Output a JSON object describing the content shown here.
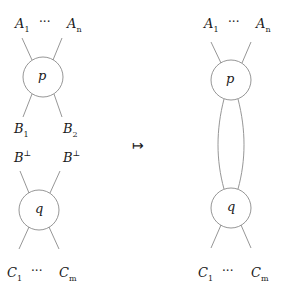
{
  "left": {
    "top_labels": {
      "first": "A",
      "first_sub": "1",
      "dots": "···",
      "last": "A",
      "last_sub": "n"
    },
    "node_p": "p",
    "mid_labels": {
      "b1": "B",
      "b1_sub": "1",
      "b2": "B",
      "b2_sub": "2"
    },
    "dual_labels": {
      "b1": "B",
      "b1_sub": "1",
      "b1_sup": "⊥",
      "b2": "B",
      "b2_sub": "2",
      "b2_sup": "⊥"
    },
    "node_q": "q",
    "bottom_labels": {
      "first": "C",
      "first_sub": "1",
      "dots": "···",
      "last": "C",
      "last_sub": "m"
    }
  },
  "arrow": "↦",
  "right": {
    "top_labels": {
      "first": "A",
      "first_sub": "1",
      "dots": "···",
      "last": "A",
      "last_sub": "n"
    },
    "node_p": "p",
    "node_q": "q",
    "bottom_labels": {
      "first": "C",
      "first_sub": "1",
      "dots": "···",
      "last": "C",
      "last_sub": "m"
    }
  },
  "colors": {
    "stroke": "#8a8a8a",
    "text": "#1a1a1a"
  }
}
